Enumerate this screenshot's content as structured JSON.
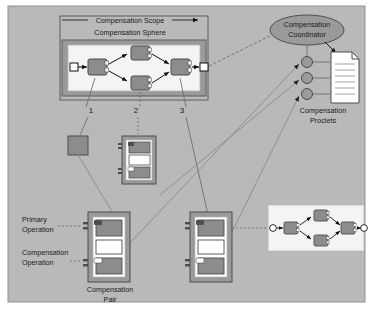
{
  "canvas": {
    "background_color": "#b9b9b9",
    "page_color": "#ffffff",
    "border_color": "#8f8f8f"
  },
  "palette": {
    "node_fill": "#8c8c8c",
    "node_stroke": "#4d4d4d",
    "sphere_frame": "#9a9a9a",
    "sphere_inner": "#f2f2f2",
    "pair_frame": "#9a9a9a",
    "pair_inner": "#ffffff",
    "pair_box": "#8c8c8c",
    "ellipse_fill": "#9a9a9a",
    "document_fill": "#ffffff",
    "line_color": "#6e6e6e",
    "arrow_color": "#111111",
    "text_color": "#1a1a1a"
  },
  "labels": {
    "compensation_scope": "Compensation Scope",
    "compensation_sphere": "Compensation Sphere",
    "compensation_coordinator_line1": "Compensation",
    "compensation_coordinator_line2": "Coordinator",
    "compensation_proclets_line1": "Compensation",
    "compensation_proclets_line2": "Proclets",
    "primary_operation_line1": "Primary",
    "primary_operation_line2": "Operation",
    "compensation_operation_line1": "Compensation",
    "compensation_operation_line2": "Operation",
    "compensation_pair_line1": "Compensation",
    "compensation_pair_line2": "Pair",
    "num_1": "1",
    "num_2": "2",
    "num_3": "3"
  },
  "diagram": {
    "type": "workflow-compensation-diagram",
    "sphere_workflow": {
      "start_node": "start-place",
      "end_node": "end-place",
      "tasks": [
        "task-a",
        "task-b-upper",
        "task-b-lower",
        "task-c"
      ],
      "flow": "start -> task-a -> {task-b-upper, task-b-lower} -> task-c -> end"
    },
    "coordinator": {
      "shape": "ellipse",
      "connects_to": [
        "proclet-1",
        "proclet-2",
        "proclet-3",
        "compensation-proclets-document"
      ]
    },
    "proclet_circles": 3,
    "document_lines": 6,
    "compensation_pairs": [
      {
        "id": "pair-plain",
        "style": "plain-square",
        "linked_number": "1"
      },
      {
        "id": "pair-middle",
        "style": "pair",
        "linked_number": "2"
      },
      {
        "id": "pair-main",
        "style": "pair",
        "labeled": true
      },
      {
        "id": "pair-right",
        "style": "pair",
        "linked_number": "3"
      }
    ],
    "mini_workflow": {
      "tasks": 4,
      "flow": "start -> task -> {task, task} -> task -> end"
    }
  }
}
